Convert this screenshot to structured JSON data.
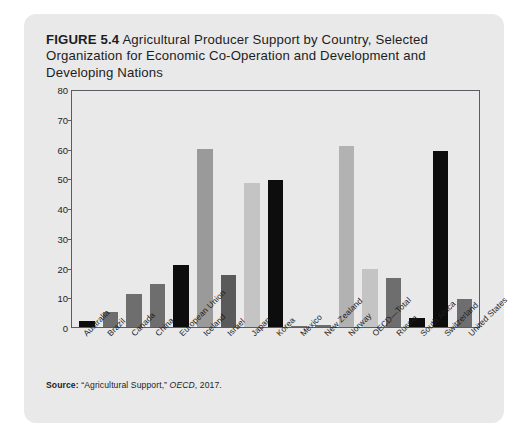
{
  "figure": {
    "number_label": "FIGURE 5.4",
    "title": "Agricultural Producer Support by Country, Selected Organization for Economic Co-Operation and Development and Developing Nations"
  },
  "source": {
    "label": "Source:",
    "text": "“Agricultural Support,”",
    "publication": "OECD",
    "year": ", 2017."
  },
  "palette": {
    "card_background": "#e9e9e9",
    "axis": "#5b5b66",
    "text": "#1d1d1d",
    "bar_dark": "#6e6e6e",
    "bar_light": "#c4c4c4",
    "bar_black": "#0d0d0d"
  },
  "chart_data": {
    "type": "bar",
    "title": "Agricultural Producer Support by Country, Selected Organization for Economic Co-Operation and Development and Developing Nations",
    "xlabel": "",
    "ylabel": "",
    "ylim": [
      0,
      80
    ],
    "yticks": [
      0,
      10,
      20,
      30,
      40,
      50,
      60,
      70,
      80
    ],
    "grid": false,
    "legend": "none",
    "categories": [
      "Australia",
      "Brazil",
      "Canada",
      "China",
      "European Union",
      "Iceland",
      "Israel",
      "Japan",
      "Korea",
      "Mexico",
      "New Zealand",
      "Norway",
      "OECD—Total",
      "Russia",
      "South Africa",
      "Switzerland",
      "United States"
    ],
    "values": [
      2,
      5,
      11,
      14.5,
      21,
      60,
      17.5,
      48.5,
      49.5,
      0.2,
      0.8,
      61,
      19.5,
      16.5,
      3,
      59,
      9.5
    ],
    "bar_colors": [
      "#0d0d0d",
      "#6e6e6e",
      "#6e6e6e",
      "#6e6e6e",
      "#0d0d0d",
      "#9a9a9a",
      "#5a5a5a",
      "#c4c4c4",
      "#0d0d0d",
      "#6e6e6e",
      "#6e6e6e",
      "#b2b2b2",
      "#c4c4c4",
      "#6e6e6e",
      "#0d0d0d",
      "#0d0d0d",
      "#6e6e6e"
    ]
  }
}
